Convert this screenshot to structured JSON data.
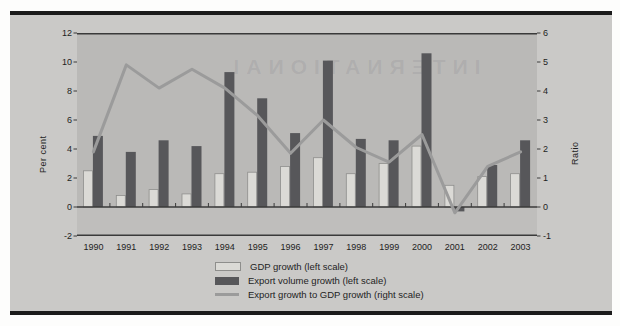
{
  "chart_data": {
    "type": "bar+line",
    "categories": [
      "1990",
      "1991",
      "1992",
      "1993",
      "1994",
      "1995",
      "1996",
      "1997",
      "1998",
      "1999",
      "2000",
      "2001",
      "2002",
      "2003"
    ],
    "series": [
      {
        "name": "GDP growth (left scale)",
        "type": "bar",
        "axis": "left",
        "values": [
          2.5,
          0.8,
          1.2,
          0.9,
          2.3,
          2.4,
          2.8,
          3.4,
          2.3,
          3.0,
          4.2,
          1.5,
          2.1,
          2.3
        ]
      },
      {
        "name": "Export volume growth (left scale)",
        "type": "bar",
        "axis": "left",
        "values": [
          4.9,
          3.8,
          4.6,
          4.2,
          9.3,
          7.5,
          5.1,
          10.1,
          4.7,
          4.6,
          10.6,
          -0.3,
          2.9,
          4.6
        ]
      },
      {
        "name": "Export growth to GDP growth (right scale)",
        "type": "line",
        "axis": "right",
        "values": [
          1.9,
          4.9,
          4.1,
          4.75,
          4.1,
          3.15,
          1.85,
          3.0,
          2.05,
          1.55,
          2.5,
          -0.2,
          1.4,
          1.9
        ]
      }
    ],
    "left_axis": {
      "label": "Per cent",
      "min": -2,
      "max": 12,
      "ticks": [
        12,
        10,
        8,
        6,
        4,
        2,
        0,
        -2
      ]
    },
    "right_axis": {
      "label": "Ratio",
      "min": -1,
      "max": 6,
      "ticks": [
        6,
        5,
        4,
        3,
        2,
        1,
        0,
        -1
      ]
    },
    "legend_position": "bottom",
    "grid": "off"
  },
  "ghost_text": "INTERNATIONAL",
  "colors": {
    "frame": "#1b1b1b",
    "figure_bg": "#cac9c7",
    "plot_bg": "#bab9b7",
    "below_zero_bg": "#bfbebc",
    "gdp_bar_fill": "#dbdad6",
    "gdp_bar_border": "#8e8e8c",
    "export_bar_fill": "#57575a",
    "ratio_line": "#9b9b9b",
    "axis_line": "#3a3a3a",
    "text": "#1e1e1e",
    "ghost": "rgba(75,75,95,0.10)"
  }
}
